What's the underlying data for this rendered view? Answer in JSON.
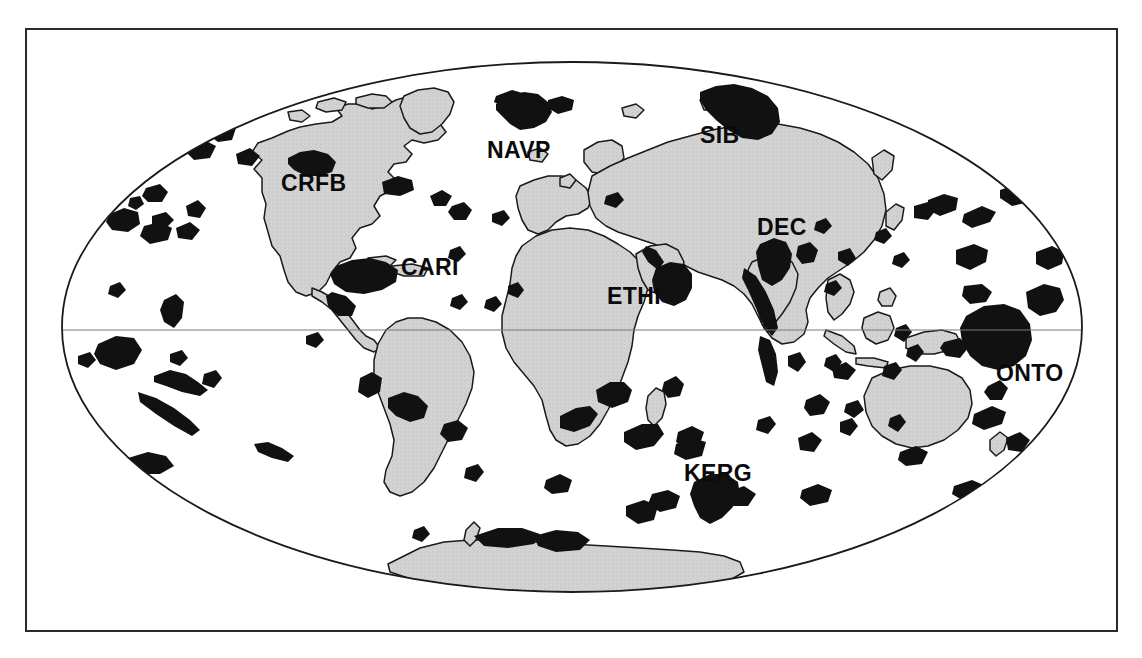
{
  "figure": {
    "type": "world-map",
    "projection": "Mollweide",
    "background_color": "#ffffff",
    "frame_color": "#2b2b2b",
    "continent_fill": "#d2d2d2",
    "continent_stroke": "#1a1a1a",
    "province_fill": "#111111",
    "graticule_color": "#6e6e6e",
    "ellipse": {
      "cx": 572,
      "cy": 327,
      "rx": 510,
      "ry": 265
    },
    "equator_y": 330
  },
  "labels": [
    {
      "id": "crfb",
      "text": "CRFB",
      "x": 281,
      "y": 172,
      "name": "Columbia River Flood Basalts"
    },
    {
      "id": "navp",
      "text": "NAVP",
      "x": 487,
      "y": 139,
      "name": "North Atlantic Volcanic Province"
    },
    {
      "id": "sib",
      "text": "SIB",
      "x": 700,
      "y": 124,
      "name": "Siberian Traps"
    },
    {
      "id": "cari",
      "text": "CARI",
      "x": 401,
      "y": 256,
      "name": "Caribbean Plateau"
    },
    {
      "id": "dec",
      "text": "DEC",
      "x": 757,
      "y": 216,
      "name": "Deccan Traps"
    },
    {
      "id": "ethi",
      "text": "ETHI",
      "x": 607,
      "y": 285,
      "name": "Ethiopian Flood Basalts"
    },
    {
      "id": "onto",
      "text": "ONTO",
      "x": 996,
      "y": 362,
      "name": "Ontong Java Plateau"
    },
    {
      "id": "kerg",
      "text": "KERG",
      "x": 684,
      "y": 462,
      "name": "Kerguelen Plateau"
    }
  ],
  "legend": {
    "province_description": "Black areas: large igneous provinces",
    "land_description": "Grey areas: continents and continental shelves"
  }
}
